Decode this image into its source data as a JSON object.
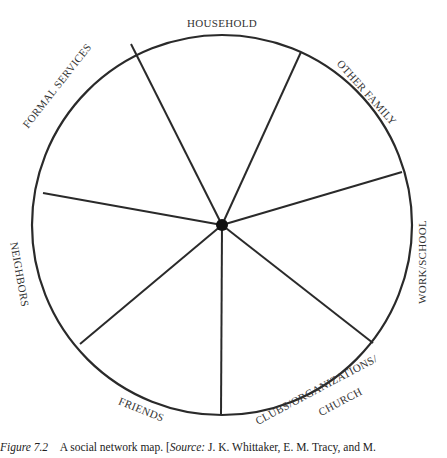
{
  "diagram": {
    "title": "Social network map",
    "circle": {
      "cx": 222,
      "cy": 225,
      "r": 190,
      "stroke": "#2a2a2a"
    },
    "hub": {
      "cx": 222,
      "cy": 225,
      "r": 6,
      "fill": "#111111"
    },
    "spokes": [
      {
        "x": 131,
        "y": 44
      },
      {
        "x": 301,
        "y": 52
      },
      {
        "x": 402,
        "y": 172
      },
      {
        "x": 373,
        "y": 343
      },
      {
        "x": 221,
        "y": 415
      },
      {
        "x": 80,
        "y": 344
      },
      {
        "x": 43,
        "y": 193
      }
    ],
    "sectors": [
      {
        "label": "HOUSEHOLD"
      },
      {
        "label": "OTHER FAMILY"
      },
      {
        "label": "WORK/SCHOOL"
      },
      {
        "label": "CLUBS/ORGANIZATIONS/"
      },
      {
        "label": "CHURCH"
      },
      {
        "label": "FRIENDS"
      },
      {
        "label": "NEIGHBORS"
      },
      {
        "label": "FORMAL SERVICES"
      }
    ]
  },
  "caption": {
    "figure_label": "Figure 7.2",
    "text": "A social network map. [",
    "source_label": "Source:",
    "source_text": " J. K. Whittaker, E. M. Tracy, and M."
  }
}
